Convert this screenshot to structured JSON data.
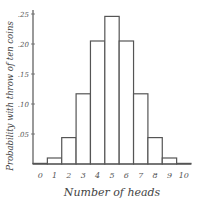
{
  "chart_data": {
    "type": "bar",
    "title": "",
    "xlabel": "Number of heads",
    "ylabel": "Probability with throw of ten coins",
    "categories": [
      "0",
      "1",
      "2",
      "3",
      "4",
      "5",
      "6",
      "7",
      "8",
      "9",
      "10"
    ],
    "values": [
      0.001,
      0.01,
      0.044,
      0.117,
      0.205,
      0.246,
      0.205,
      0.117,
      0.044,
      0.01,
      0.001
    ],
    "ylim": [
      0,
      0.26
    ],
    "yticks": [
      0.05,
      0.1,
      0.15,
      0.2,
      0.25
    ],
    "ytick_labels": [
      ".05",
      ".10",
      ".15",
      ".20",
      ".25"
    ],
    "grid": false,
    "legend": "none"
  }
}
